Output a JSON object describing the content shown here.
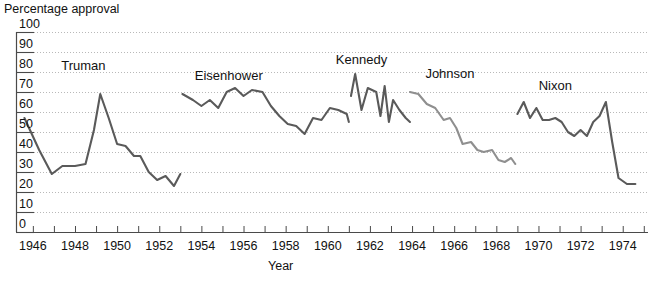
{
  "chart_data": {
    "type": "line",
    "title": "",
    "ylabel": "Percentage approval",
    "xlabel": "Year",
    "ylim": [
      0,
      100
    ],
    "xlim": [
      1945.2,
      1975.2
    ],
    "grid": true,
    "legend_position": "inline-annotations",
    "ytick_labels": [
      "0",
      "10",
      "20",
      "30",
      "40",
      "50",
      "60",
      "70",
      "80",
      "90",
      "100"
    ],
    "ytick_values": [
      0,
      10,
      20,
      30,
      40,
      50,
      60,
      70,
      80,
      90,
      100
    ],
    "xtick_labels": [
      "1946",
      "1948",
      "1950",
      "1952",
      "1954",
      "1956",
      "1958",
      "1960",
      "1962",
      "1964",
      "1966",
      "1968",
      "1970",
      "1972",
      "1974"
    ],
    "xtick_values": [
      1946,
      1948,
      1950,
      1952,
      1954,
      1956,
      1958,
      1960,
      1962,
      1964,
      1966,
      1968,
      1970,
      1972,
      1974
    ],
    "xminor_values": [
      1945,
      1946,
      1947,
      1948,
      1949,
      1950,
      1951,
      1952,
      1953,
      1954,
      1955,
      1956,
      1957,
      1958,
      1959,
      1960,
      1961,
      1962,
      1963,
      1964,
      1965,
      1966,
      1967,
      1968,
      1969,
      1970,
      1971,
      1972,
      1973,
      1974,
      1975
    ],
    "colors": {
      "dark_line": "#5a5a5a",
      "light_line": "#8f8f8f",
      "grid": "#b9b9b9",
      "axis": "#4a4a4a",
      "text": "#111111"
    },
    "annotations": [
      {
        "text": "Truman",
        "x": 1948.4,
        "y": 83
      },
      {
        "text": "Eisenhower",
        "x": 1955.3,
        "y": 78
      },
      {
        "text": "Kennedy",
        "x": 1961.6,
        "y": 86
      },
      {
        "text": "Johnson",
        "x": 1965.8,
        "y": 79
      },
      {
        "text": "Nixon",
        "x": 1970.8,
        "y": 73
      }
    ],
    "series": [
      {
        "name": "Truman",
        "color": "dark_line",
        "x": [
          1945.6,
          1946.3,
          1946.9,
          1947.4,
          1948.0,
          1948.5,
          1948.9,
          1949.2,
          1949.6,
          1950.0,
          1950.4,
          1950.8,
          1951.1,
          1951.5,
          1951.9,
          1952.3,
          1952.7,
          1953.0
        ],
        "y": [
          57,
          41,
          29,
          33,
          33,
          34,
          51,
          69,
          57,
          44,
          43,
          38,
          38,
          30,
          26,
          28,
          23,
          29
        ]
      },
      {
        "name": "Eisenhower",
        "color": "dark_line",
        "x": [
          1953.1,
          1953.6,
          1954.0,
          1954.4,
          1954.8,
          1955.2,
          1955.6,
          1956.0,
          1956.4,
          1956.9,
          1957.3,
          1957.7,
          1958.1,
          1958.5,
          1958.9,
          1959.3,
          1959.7,
          1960.1,
          1960.5,
          1960.9,
          1961.0
        ],
        "y": [
          69,
          66,
          63,
          66,
          62,
          70,
          72,
          68,
          71,
          70,
          63,
          58,
          54,
          53,
          49,
          57,
          56,
          62,
          61,
          59,
          55
        ]
      },
      {
        "name": "Kennedy",
        "color": "dark_line",
        "x": [
          1961.1,
          1961.3,
          1961.6,
          1961.9,
          1962.1,
          1962.3,
          1962.5,
          1962.7,
          1962.9,
          1963.1,
          1963.4,
          1963.7,
          1963.9
        ],
        "y": [
          68,
          79,
          61,
          72,
          71,
          70,
          58,
          73,
          55,
          66,
          61,
          57,
          55
        ]
      },
      {
        "name": "Johnson",
        "color": "light_line",
        "x": [
          1963.9,
          1964.3,
          1964.7,
          1965.1,
          1965.5,
          1965.8,
          1966.1,
          1966.4,
          1966.8,
          1967.1,
          1967.4,
          1967.8,
          1968.1,
          1968.4,
          1968.7,
          1968.9
        ],
        "y": [
          70,
          69,
          64,
          62,
          56,
          57,
          52,
          44,
          45,
          41,
          40,
          41,
          36,
          35,
          37,
          34
        ]
      },
      {
        "name": "Nixon",
        "color": "dark_line",
        "x": [
          1969.0,
          1969.3,
          1969.6,
          1969.9,
          1970.2,
          1970.5,
          1970.8,
          1971.1,
          1971.4,
          1971.7,
          1972.0,
          1972.3,
          1972.6,
          1972.9,
          1973.2,
          1973.5,
          1973.8,
          1974.2,
          1974.6
        ],
        "y": [
          59,
          65,
          57,
          62,
          56,
          56,
          57,
          55,
          50,
          48,
          51,
          48,
          55,
          58,
          65,
          45,
          27,
          24,
          24
        ]
      }
    ]
  }
}
